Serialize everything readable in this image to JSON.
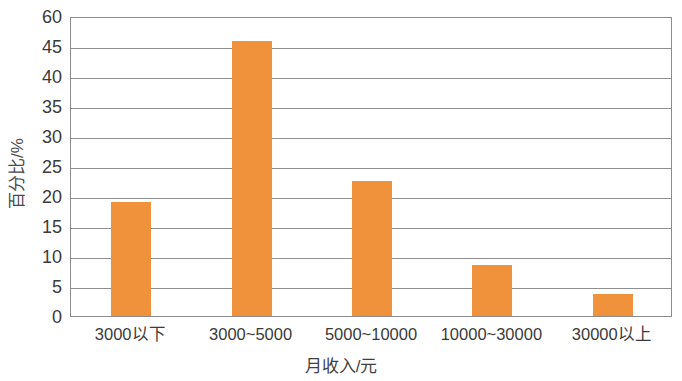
{
  "chart_data": {
    "type": "bar",
    "title": "",
    "subtitle": "",
    "xlabel": "月收入/元",
    "ylabel": "百分比/%",
    "categories": [
      "3000以下",
      "3000~5000",
      "5000~10000",
      "10000~30000",
      "30000以上"
    ],
    "values": [
      19.0,
      45.8,
      22.5,
      8.5,
      3.7
    ],
    "series": [
      {
        "name": "百分比",
        "values": [
          19.0,
          45.8,
          22.5,
          8.5,
          3.7
        ],
        "color": "#f0913c"
      }
    ],
    "ytick_labels": [
      "0",
      "5",
      "10",
      "15",
      "20",
      "25",
      "30",
      "35",
      "40",
      "45",
      "60"
    ],
    "ytick_positions": [
      0,
      5,
      10,
      15,
      20,
      25,
      30,
      35,
      40,
      45,
      50
    ],
    "ylim": [
      0,
      50
    ],
    "grid": "horizontal",
    "legend": "none",
    "bar_color": "#f0913c",
    "axis_color": "#8c8c8c",
    "gridline_color": "#8f8f8f",
    "text_color": "#3b3b3b",
    "background": "#ffffff"
  }
}
